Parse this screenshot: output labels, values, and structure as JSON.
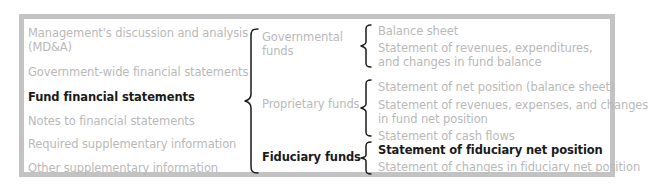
{
  "diagram": {
    "components": [
      {
        "label_lines": [
          "Management's discussion and analysis",
          "(MD&A)"
        ],
        "highlighted": false
      },
      {
        "label_lines": [
          "Government-wide financial statements"
        ],
        "highlighted": false
      },
      {
        "label_lines": [
          "Fund financial statements"
        ],
        "highlighted": true
      },
      {
        "label_lines": [
          "Notes to financial statements"
        ],
        "highlighted": false
      },
      {
        "label_lines": [
          "Required supplementary information"
        ],
        "highlighted": false
      },
      {
        "label_lines": [
          "Other supplementary information"
        ],
        "highlighted": false
      }
    ],
    "fund_types": [
      {
        "label_lines": [
          "Governmental",
          "funds"
        ],
        "highlighted": false,
        "statements": [
          {
            "label_lines": [
              "Balance sheet"
            ],
            "highlighted": false
          },
          {
            "label_lines": [
              "Statement of revenues, expenditures,",
              "and changes in fund balance"
            ],
            "highlighted": false
          }
        ]
      },
      {
        "label_lines": [
          "Proprietary funds"
        ],
        "highlighted": false,
        "statements": [
          {
            "label_lines": [
              "Statement of net position (balance sheet)"
            ],
            "highlighted": false
          },
          {
            "label_lines": [
              "Statement of revenues, expenses, and changes",
              "in fund net position"
            ],
            "highlighted": false
          },
          {
            "label_lines": [
              "Statement of cash flows"
            ],
            "highlighted": false
          }
        ]
      },
      {
        "label_lines": [
          "Fiduciary funds"
        ],
        "highlighted": true,
        "statements": [
          {
            "label_lines": [
              "Statement of fiduciary net position"
            ],
            "highlighted": true
          },
          {
            "label_lines": [
              "Statement of changes in fiduciary net position"
            ],
            "highlighted": false
          }
        ]
      }
    ],
    "colors": {
      "frame_border": "#c3c3c3",
      "muted_text": "#b9b9b9",
      "highlight_text": "#1a1a1a",
      "brace": "#1a1a1a"
    }
  }
}
